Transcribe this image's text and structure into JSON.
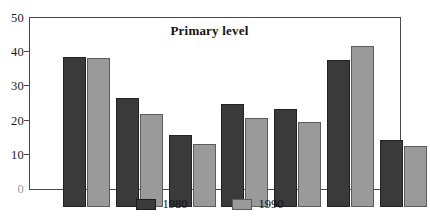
{
  "chart_data": {
    "type": "bar",
    "title": "Primary level",
    "xlabel": "",
    "ylabel": "",
    "ylim": [
      0,
      50
    ],
    "yticks": [
      0,
      10,
      20,
      30,
      40,
      50
    ],
    "ytick_labels": [
      "0",
      "10",
      "20",
      "30",
      "40",
      "50"
    ],
    "grid": false,
    "legend_position": "bottom-center",
    "categories": [
      "",
      "",
      "",
      "",
      "",
      "",
      ""
    ],
    "series": [
      {
        "name": "1980",
        "color": "#3a3a3a",
        "values": [
          44,
          32,
          21,
          30,
          28.8,
          43,
          19.7
        ]
      },
      {
        "name": "1990",
        "color": "#9a9a9a",
        "values": [
          43.5,
          27.2,
          18.5,
          26,
          24.8,
          47,
          17.7
        ]
      }
    ]
  },
  "legend": {
    "entries": [
      {
        "label": "1980"
      },
      {
        "label": "1990"
      }
    ]
  },
  "colors": {
    "series_1980": "#3a3a3a",
    "series_1990": "#9a9a9a",
    "axis": "#4a4a4a",
    "text": "#141414",
    "background": "#ffffff"
  }
}
